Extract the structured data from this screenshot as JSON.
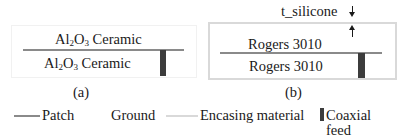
{
  "figure": {
    "panel_a": {
      "caption": "(a)",
      "top_layer": {
        "prefix": "Al",
        "sub1": "2",
        "mid": "O",
        "sub2": "3",
        "suffix": " Ceramic"
      },
      "bottom_layer": {
        "prefix": "Al",
        "sub1": "2",
        "mid": "O",
        "sub2": "3",
        "suffix": " Ceramic"
      }
    },
    "panel_b": {
      "caption": "(b)",
      "dimension_label": "t_silicone",
      "top_layer": "Rogers 3010",
      "bottom_layer": "Rogers 3010"
    }
  },
  "legend": {
    "items": [
      {
        "label": "Patch",
        "color": "#8a8a8a",
        "swatch": "line"
      },
      {
        "label": "Ground",
        "color": "#ffffff",
        "swatch": "line"
      },
      {
        "label": "Encasing material",
        "color": "#d9d9d9",
        "swatch": "line"
      },
      {
        "label": "Coaxial",
        "label2": "feed",
        "color": "#3c3c3c",
        "swatch": "bar"
      }
    ]
  },
  "colors": {
    "patch": "#8a8a8a",
    "encasing": "#d9d9d9",
    "coaxial_feed": "#3c3c3c",
    "text": "#1a1a1a"
  }
}
